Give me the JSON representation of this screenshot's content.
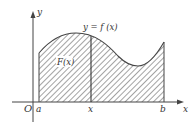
{
  "diagram": {
    "curve_label": "y = f (x)",
    "area_label": "F(x)",
    "axes": {
      "x_axis_label": "x",
      "y_axis_label": "y",
      "origin_label": "O"
    },
    "ticks": {
      "a": "a",
      "x": "x",
      "b": "b"
    },
    "colors": {
      "line": "#444444",
      "hatch": "#555555",
      "background": "#ffffff"
    }
  }
}
